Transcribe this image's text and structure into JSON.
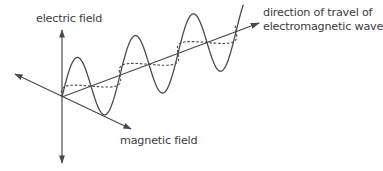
{
  "diagram": {
    "title": "Electromagnetic wave",
    "labels": {
      "electric_field": "electric field",
      "magnetic_field": "magnetic field",
      "direction_line1": "direction of travel of",
      "direction_line2": "electromagnetic wave"
    },
    "colors": {
      "line": "#4a4a4a",
      "text": "#3c3c3c",
      "background": "#ffffff"
    },
    "geometry": {
      "origin": [
        62,
        97
      ],
      "electric_axis": {
        "top": [
          62,
          30
        ],
        "bottom": [
          62,
          163
        ]
      },
      "magnetic_axis": {
        "start": [
          15,
          74
        ],
        "end": [
          131,
          129
        ]
      },
      "propagation_axis": {
        "start": [
          62,
          97
        ],
        "end": [
          259,
          23
        ]
      },
      "wave": {
        "half_wavelength_x": 29,
        "half_cycles": 6.25,
        "electric_amplitude": 34,
        "magnetic_amplitude_x": 11,
        "magnetic_amplitude_y": 5.2
      }
    }
  }
}
